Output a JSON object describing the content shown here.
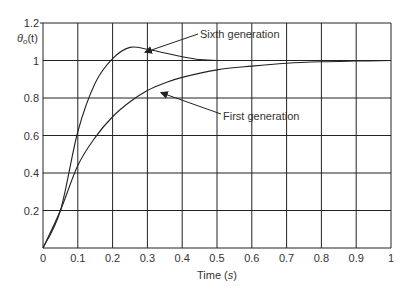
{
  "chart_data": {
    "type": "line",
    "title": "",
    "xlabel": "Time (s)",
    "ylabel": "θo(t)",
    "xlim": [
      0,
      1
    ],
    "ylim": [
      0,
      1.2
    ],
    "grid": true,
    "x_ticks": [
      "0",
      "0.1",
      "0.2",
      "0.3",
      "0.4",
      "0.5",
      "0.6",
      "0.7",
      "0.8",
      "0.9",
      "1"
    ],
    "y_ticks": [
      "0.2",
      "0.4",
      "0.6",
      "0.8",
      "1",
      "1.2"
    ],
    "series": [
      {
        "name": "Sixth generation",
        "x": [
          0,
          0.05,
          0.1,
          0.15,
          0.2,
          0.25,
          0.3,
          0.35,
          0.4,
          0.45,
          0.5,
          0.6,
          0.7,
          0.8,
          0.9,
          1.0
        ],
        "values": [
          0,
          0.2,
          0.62,
          0.88,
          1.01,
          1.07,
          1.06,
          1.04,
          1.02,
          1.005,
          1.0,
          1.0,
          1.0,
          1.0,
          1.0,
          1.0
        ]
      },
      {
        "name": "First generation",
        "x": [
          0,
          0.05,
          0.1,
          0.15,
          0.2,
          0.25,
          0.3,
          0.35,
          0.4,
          0.5,
          0.6,
          0.7,
          0.8,
          0.9,
          1.0
        ],
        "values": [
          0,
          0.2,
          0.44,
          0.59,
          0.7,
          0.78,
          0.84,
          0.88,
          0.91,
          0.95,
          0.97,
          0.985,
          0.993,
          0.997,
          1.0
        ]
      }
    ],
    "annotations": [
      {
        "text": "Sixth generation",
        "points_to": [
          0.27,
          1.06
        ]
      },
      {
        "text": "First generation",
        "points_to": [
          0.33,
          0.85
        ]
      }
    ]
  }
}
